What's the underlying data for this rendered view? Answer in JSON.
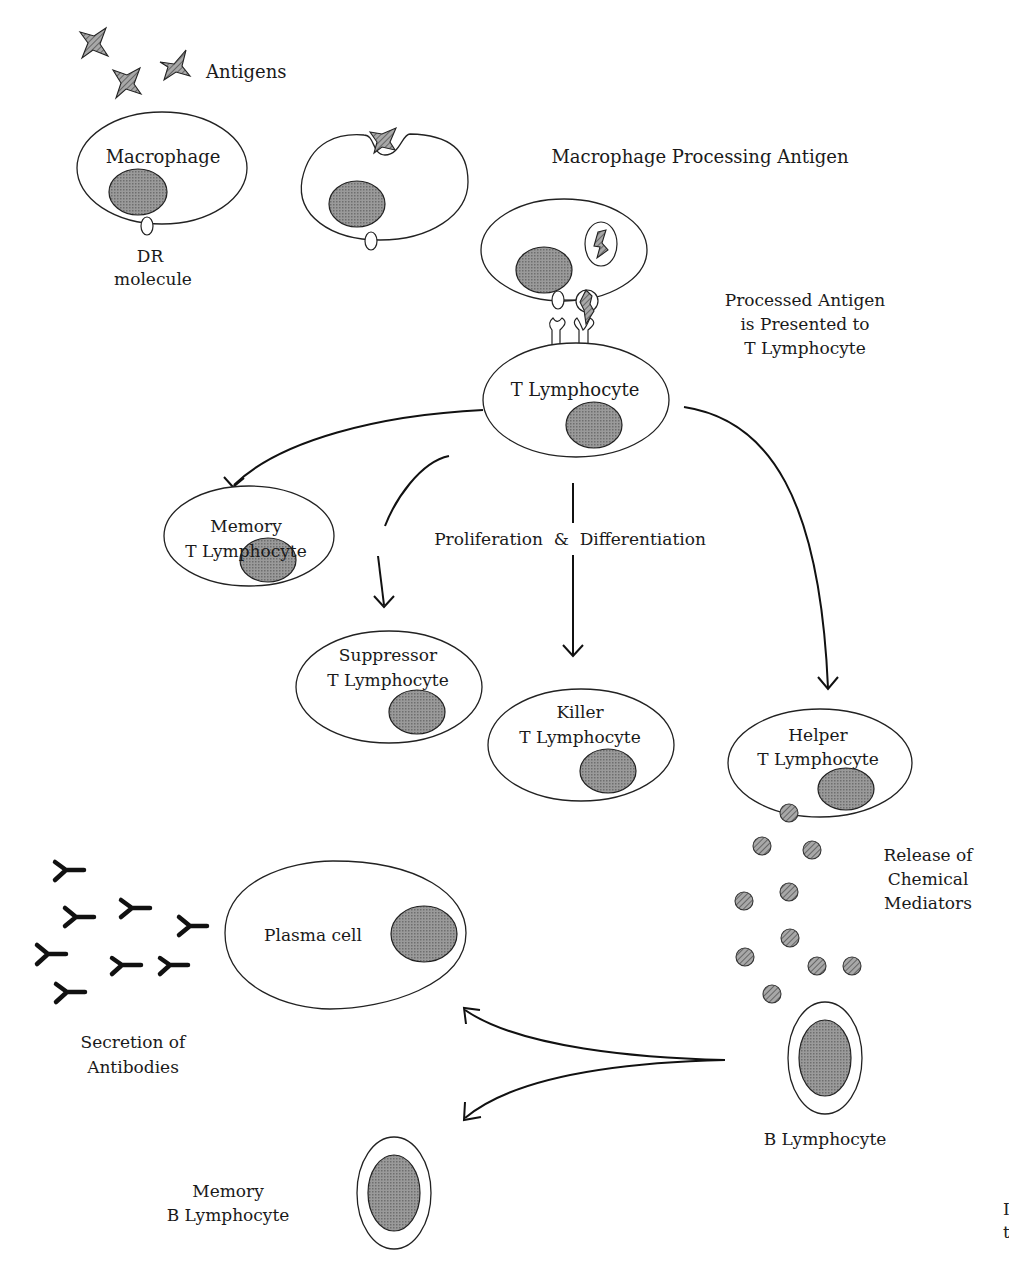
{
  "labels": {
    "antigens": "Antigens",
    "macrophage": "Macrophage",
    "dr_molecule_line1": "DR",
    "dr_molecule_line2": "molecule",
    "macrophage_processing": "Macrophage Processing Antigen",
    "presented_line1": "Processed Antigen",
    "presented_line2": "is Presented to",
    "presented_line3": "T Lymphocyte",
    "t_lymphocyte": "T Lymphocyte",
    "proliferation": "Proliferation  &  Differentiation",
    "memory_t_line1": "Memory",
    "memory_t_line2": "T Lymphocyte",
    "suppressor_line1": "Suppressor",
    "suppressor_line2": "T Lymphocyte",
    "killer_line1": "Killer",
    "killer_line2": "T Lymphocyte",
    "helper_line1": "Helper",
    "helper_line2": "T Lymphocyte",
    "release_line1": "Release of",
    "release_line2": "Chemical",
    "release_line3": "Mediators",
    "plasma_cell": "Plasma cell",
    "secretion_line1": "Secretion of",
    "secretion_line2": "Antibodies",
    "b_lymphocyte": "B Lymphocyte",
    "memory_b_line1": "Memory",
    "memory_b_line2": "B Lymphocyte",
    "edge_fragment_1": "I",
    "edge_fragment_2": "t"
  },
  "colors": {
    "stroke": "#222222",
    "nucleus_fill": "#8a8a8a",
    "background": "#ffffff"
  }
}
